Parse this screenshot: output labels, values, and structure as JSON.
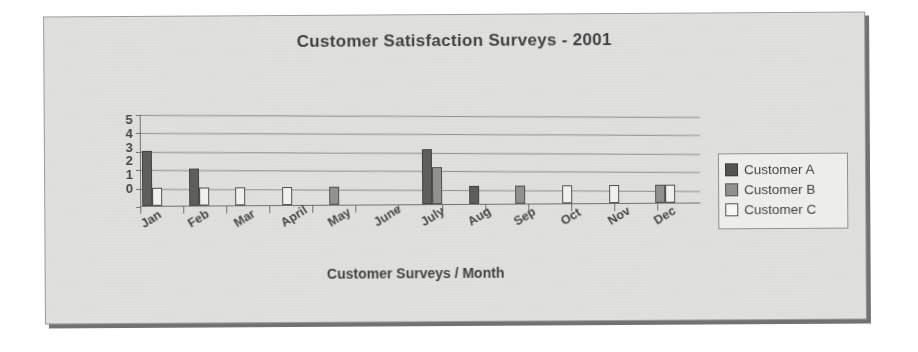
{
  "chart_data": {
    "type": "bar",
    "title": "Customer Satisfaction Surveys - 2001",
    "xlabel": "Customer Surveys / Month",
    "ylabel": "",
    "ylim": [
      0,
      5
    ],
    "yticks": [
      "5",
      "4",
      "3",
      "2",
      "1",
      "0"
    ],
    "grid": true,
    "legend_position": "right",
    "categories": [
      "Jan",
      "Feb",
      "Mar",
      "April",
      "May",
      "June",
      "July",
      "Aug",
      "Sep",
      "Oct",
      "Nov",
      "Dec"
    ],
    "series": [
      {
        "name": "Customer A",
        "color": "#5a5a58",
        "values": [
          3,
          2,
          0,
          0,
          0,
          0,
          3,
          1,
          0,
          0,
          0,
          0
        ]
      },
      {
        "name": "Customer B",
        "color": "#8f8f8d",
        "values": [
          0,
          0,
          0,
          0,
          1,
          0,
          2,
          0,
          1,
          0,
          0,
          1
        ]
      },
      {
        "name": "Customer C",
        "color": "#f3f3f1",
        "values": [
          1,
          1,
          1,
          1,
          0,
          0,
          0,
          0,
          0,
          1,
          1,
          1
        ]
      }
    ]
  },
  "legend": {
    "items": [
      {
        "label": "Customer A",
        "swatch": "dark-gray"
      },
      {
        "label": "Customer B",
        "swatch": "medium-gray"
      },
      {
        "label": "Customer C",
        "swatch": "white"
      }
    ]
  },
  "colors": {
    "series_a": "#5a5a58",
    "series_b": "#8f8f8d",
    "series_c": "#f3f3f1",
    "plot_background": "#e3e3e1",
    "gridline": "#8d8d8b",
    "text": "#3b3b3b"
  }
}
